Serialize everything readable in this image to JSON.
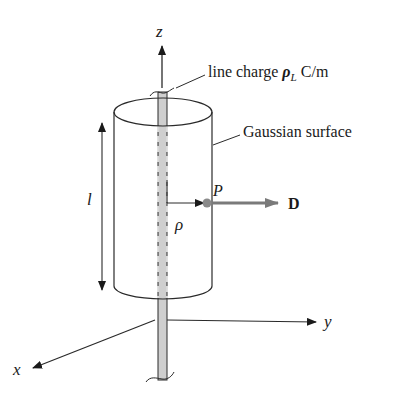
{
  "diagram": {
    "labels": {
      "z_axis": "z",
      "x_axis": "x",
      "y_axis": "y",
      "line_charge_prefix": "line charge ",
      "line_charge_symbol": "ρ",
      "line_charge_subscript": "L",
      "line_charge_units": " C/m",
      "gaussian_surface": "Gaussian surface",
      "length": "l",
      "point": "P",
      "field": "D",
      "radius": "ρ"
    },
    "colors": {
      "line": "#2a2a2a",
      "rod_fill": "#cfcfcf",
      "field_arrow": "#7a7a7a",
      "point": "#8a8a8a"
    }
  }
}
